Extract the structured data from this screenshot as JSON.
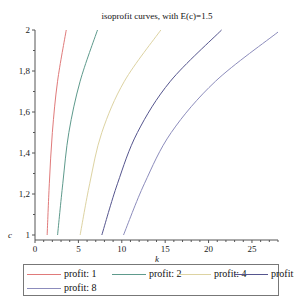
{
  "chart_data": {
    "type": "line",
    "title": "isoprofit curves, with E(c)=1.5",
    "xlabel": "k",
    "ylabel": "c",
    "xlim": [
      0,
      28
    ],
    "ylim": [
      1,
      2
    ],
    "x_ticks": [
      0,
      5,
      10,
      15,
      20,
      25
    ],
    "x_tick_labels": [
      "0",
      "5",
      "10",
      "15",
      "20",
      "25"
    ],
    "y_ticks": [
      1,
      1.2,
      1.4,
      1.6,
      1.8,
      2
    ],
    "y_tick_labels": [
      "1",
      "1,2",
      "1,4",
      "1,6",
      "1,8",
      "2"
    ],
    "grid": false,
    "legend_position": "bottom",
    "series": [
      {
        "name": "profit: 1",
        "color": "#e07a7a",
        "points": [
          [
            1.4,
            1.0
          ],
          [
            1.65,
            1.25
          ],
          [
            2.0,
            1.5
          ],
          [
            2.6,
            1.75
          ],
          [
            3.6,
            2.0
          ]
        ]
      },
      {
        "name": "profit: 2",
        "color": "#5e9a8c",
        "points": [
          [
            2.6,
            1.0
          ],
          [
            3.2,
            1.25
          ],
          [
            3.9,
            1.5
          ],
          [
            5.2,
            1.75
          ],
          [
            7.2,
            2.0
          ]
        ]
      },
      {
        "name": "profit: 4",
        "color": "#ddd3a2",
        "points": [
          [
            5.2,
            1.0
          ],
          [
            6.3,
            1.25
          ],
          [
            7.7,
            1.5
          ],
          [
            10.3,
            1.75
          ],
          [
            14.5,
            2.0
          ]
        ]
      },
      {
        "name": "profit: 6",
        "color": "#55558e",
        "points": [
          [
            7.7,
            1.0
          ],
          [
            9.5,
            1.25
          ],
          [
            11.8,
            1.5
          ],
          [
            15.6,
            1.75
          ],
          [
            21.5,
            2.0
          ]
        ]
      },
      {
        "name": "profit: 8",
        "color": "#8c8cbc",
        "points": [
          [
            10.2,
            1.0
          ],
          [
            12.6,
            1.25
          ],
          [
            15.7,
            1.5
          ],
          [
            20.8,
            1.75
          ],
          [
            28.0,
            1.99
          ]
        ]
      }
    ]
  },
  "legend": {
    "items": [
      {
        "label": "profit: 1",
        "color": "#e07a7a"
      },
      {
        "label": "profit: 2",
        "color": "#5e9a8c"
      },
      {
        "label": "profit: 4",
        "color": "#ddd3a2"
      },
      {
        "label": "profit: 6",
        "color": "#55558e"
      },
      {
        "label": "profit: 8",
        "color": "#8c8cbc"
      }
    ]
  }
}
